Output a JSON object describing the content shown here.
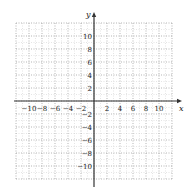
{
  "chart_data": {
    "type": "scatter",
    "title": "",
    "xlabel": "x",
    "ylabel": "y",
    "xlim": [
      -12,
      12
    ],
    "ylim": [
      -12,
      12
    ],
    "grid": true,
    "grid_style": "dotted",
    "grid_step": 2,
    "x_ticks": [
      -10,
      -8,
      -6,
      -4,
      -2,
      2,
      4,
      6,
      8,
      10
    ],
    "y_ticks": [
      10,
      8,
      6,
      4,
      2,
      -2,
      -4,
      -6,
      -8,
      -10
    ],
    "series": []
  },
  "colors": {
    "axis": "#333333",
    "grid": "#999999",
    "background": "#ffffff"
  }
}
